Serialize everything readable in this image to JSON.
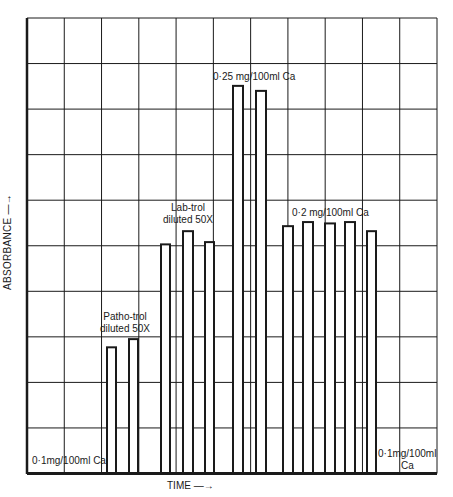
{
  "chart_data": {
    "type": "bar",
    "title": "",
    "xlabel": "TIME →",
    "ylabel": "ABSORBANCE →",
    "grid": true,
    "grid_columns": 11,
    "grid_rows": 10,
    "ylim": [
      0,
      10
    ],
    "y_units": "grid divisions (no numeric tick labels shown)",
    "groups": [
      {
        "label": "0·1mg/100ml Ca",
        "values": [
          0
        ]
      },
      {
        "label": "Patho-trol diluted 50X",
        "values": [
          2.77,
          2.95
        ]
      },
      {
        "label": "Lab-trol diluted 50X",
        "values": [
          5.03,
          5.32,
          5.08
        ]
      },
      {
        "label": "0·25 mg/100ml Ca",
        "values": [
          8.51,
          8.4
        ]
      },
      {
        "label": "0·2 mg/100ml Ca",
        "values": [
          5.43,
          5.52,
          5.49,
          5.52,
          5.32
        ]
      },
      {
        "label": "0·1mg/100ml Ca",
        "values": [
          0
        ]
      }
    ],
    "bars": [
      {
        "x": 107,
        "w": 9,
        "value": 2.77
      },
      {
        "x": 129,
        "w": 9,
        "value": 2.95
      },
      {
        "x": 161,
        "w": 9,
        "value": 5.03
      },
      {
        "x": 183,
        "w": 10,
        "value": 5.32
      },
      {
        "x": 205,
        "w": 9,
        "value": 5.08
      },
      {
        "x": 233,
        "w": 10,
        "value": 8.51
      },
      {
        "x": 256,
        "w": 10,
        "value": 8.4
      },
      {
        "x": 283,
        "w": 10,
        "value": 5.43
      },
      {
        "x": 303,
        "w": 10,
        "value": 5.52
      },
      {
        "x": 325,
        "w": 10,
        "value": 5.49
      },
      {
        "x": 345,
        "w": 10,
        "value": 5.52
      },
      {
        "x": 367,
        "w": 9,
        "value": 5.32
      }
    ]
  },
  "labels": {
    "ylabel": "ABSORBANCE —→",
    "xlabel": "TIME —→",
    "baseline_left": "0·1mg/100ml Ca",
    "patho_line1": "Patho-trol",
    "patho_line2": "diluted 50X",
    "lab_line1": "Lab-trol",
    "lab_line2": "diluted 50X",
    "std025": "0·25 mg/100ml Ca",
    "std02": "0·2 mg/100ml Ca",
    "baseline_right_line1": "0·1mg/100ml",
    "baseline_right_line2": "Ca"
  },
  "colors": {
    "ink": "#1a1a1a",
    "background": "#ffffff"
  }
}
